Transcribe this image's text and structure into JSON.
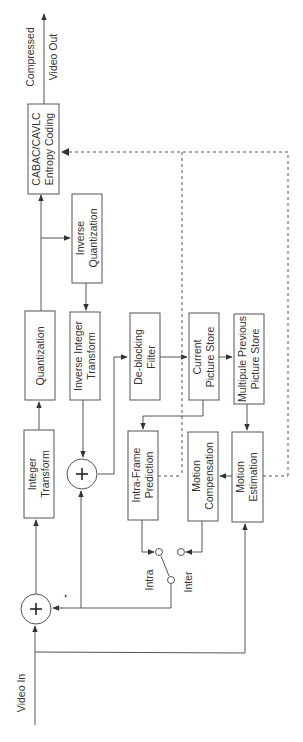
{
  "diagram": {
    "orientation": "rotated 90 degrees counter-clockwise",
    "colors": {
      "stroke": "#555555",
      "text": "#333333",
      "background": "#ffffff"
    },
    "blocks": [
      {
        "id": "cabac",
        "line1": "CABAC/CAVLC",
        "line2": "Entropy Coding"
      },
      {
        "id": "inv_quant",
        "line1": "Inverse",
        "line2": "Quantization"
      },
      {
        "id": "quant",
        "line1": "Quantization",
        "line2": ""
      },
      {
        "id": "inv_int_transform",
        "line1": "Inverse Integer",
        "line2": "Transform"
      },
      {
        "id": "deblock",
        "line1": "De-blocking",
        "line2": "Filter"
      },
      {
        "id": "current_store",
        "line1": "Current",
        "line2": "Picture Store"
      },
      {
        "id": "prev_store",
        "line1": "Multipule Previous",
        "line2": "Picture Store"
      },
      {
        "id": "int_transform",
        "line1": "Integer",
        "line2": "Transform"
      },
      {
        "id": "intra_pred",
        "line1": "Intra-Frame",
        "line2": "Prediction"
      },
      {
        "id": "motion_comp",
        "line1": "Motion",
        "line2": "Compensation"
      },
      {
        "id": "motion_est",
        "line1": "Motion",
        "line2": "Estimation"
      }
    ],
    "labels": {
      "output_line1": "Compressed",
      "output_line2": "Video Out",
      "input": "Video In",
      "switch_intra": "Intra",
      "switch_inter": "Inter",
      "minus_sign": "-",
      "plus_sign": "+"
    },
    "summing_junctions": [
      {
        "id": "input_subtractor",
        "inputs": [
          "Video In (+)",
          "Prediction (-)"
        ]
      },
      {
        "id": "reconstruction_adder",
        "inputs": [
          "Inverse Integer Transform",
          "Prediction"
        ]
      }
    ],
    "switch": {
      "positions": [
        "Intra",
        "Inter"
      ],
      "selected": "Intra"
    }
  }
}
